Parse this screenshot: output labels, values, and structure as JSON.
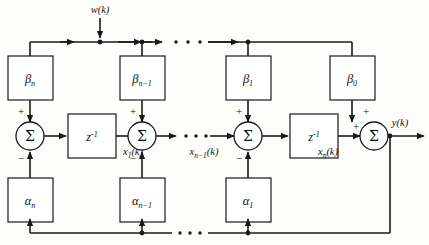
{
  "diagram": {
    "input_signal": {
      "label": "w(k)",
      "base": "w",
      "arg": "(k)"
    },
    "output_signal": {
      "label": "y(k)",
      "base": "y",
      "arg": "(k)"
    },
    "delay_block_label": "z",
    "delay_block_exponent": "-1",
    "sum_symbol": "Σ",
    "sign_plus": "+",
    "sign_minus": "−",
    "ellipsis": "· · ·",
    "colors": {
      "line": "#1a1a1a",
      "block_fill": "#ffffff",
      "background": "#fdfdfb",
      "text": "#111111"
    },
    "feedforward_gains": [
      {
        "id": "beta-n",
        "base": "β",
        "sub": "n"
      },
      {
        "id": "beta-n-1",
        "base": "β",
        "sub": "n−1"
      },
      {
        "id": "beta-1",
        "base": "β",
        "sub": "1"
      },
      {
        "id": "beta-0",
        "base": "β",
        "sub": "0"
      }
    ],
    "feedback_gains": [
      {
        "id": "alpha-n",
        "base": "α",
        "sub": "n"
      },
      {
        "id": "alpha-n-1",
        "base": "α",
        "sub": "n−1"
      },
      {
        "id": "alpha-1",
        "base": "α",
        "sub": "1"
      }
    ],
    "state_signals": [
      {
        "id": "x1",
        "base": "x",
        "sub": "1",
        "arg": "(k)"
      },
      {
        "id": "xn-1",
        "base": "x",
        "sub": "n−1",
        "arg": "(k)"
      },
      {
        "id": "xn",
        "base": "x",
        "sub": "n",
        "arg": "(k)"
      }
    ],
    "summers": [
      {
        "id": "sum-1",
        "top_sign": "+",
        "bottom_sign": "−"
      },
      {
        "id": "sum-2",
        "top_sign": "+",
        "bottom_sign": "−"
      },
      {
        "id": "sum-3",
        "top_sign": "+",
        "bottom_sign": "−"
      },
      {
        "id": "sum-4",
        "top_sign": "+",
        "left_sign": "+"
      }
    ],
    "delays": [
      {
        "id": "delay-1"
      },
      {
        "id": "delay-2"
      }
    ]
  }
}
